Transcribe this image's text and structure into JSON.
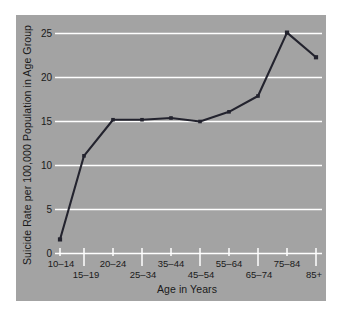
{
  "figure": {
    "panel_color": "#a3a3a3",
    "background_color": "#ffffff",
    "grid_color": "#ffffff",
    "series_color": "#23232e"
  },
  "axes": {
    "y_title": "Suicide Rate per 100,000 Population in Age Group",
    "x_title": "Age in Years",
    "y_ticks": [
      "0",
      "5",
      "10",
      "15",
      "20",
      "25"
    ],
    "x_ticks": [
      "10–14",
      "15–19",
      "20–24",
      "25–34",
      "35–44",
      "45–54",
      "55–64",
      "65–74",
      "75–84",
      "85+"
    ]
  },
  "chart_data": {
    "type": "line",
    "title": "",
    "xlabel": "Age in Years",
    "ylabel": "Suicide Rate per 100,000 Population in Age Group",
    "categories": [
      "10–14",
      "15–19",
      "20–24",
      "25–34",
      "35–44",
      "45–54",
      "55–64",
      "65–74",
      "75–84",
      "85+"
    ],
    "values": [
      1.6,
      11.1,
      15.2,
      15.2,
      15.4,
      15.0,
      16.1,
      17.9,
      25.1,
      22.3
    ],
    "ylim": [
      0,
      26.5
    ],
    "ytick_values": [
      0,
      5,
      10,
      15,
      20,
      25
    ],
    "grid": "horizontal",
    "legend": "none",
    "marker": "square",
    "series_name": "Suicide rate"
  }
}
